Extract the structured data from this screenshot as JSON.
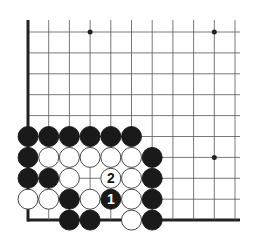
{
  "diagram": {
    "type": "go-board-corner",
    "grid": {
      "origin_x": 28,
      "origin_y": 32,
      "step_x": 20.7,
      "step_y": 20.9,
      "cols": 11,
      "rows": 10,
      "left_edge": true,
      "bottom_edge": true,
      "line_color": "#555555",
      "edge_color": "#222222"
    },
    "star_points": [
      [
        3,
        0
      ],
      [
        9,
        0
      ],
      [
        9,
        6
      ]
    ],
    "stones": [
      {
        "c": 0,
        "r": 5,
        "color": "black"
      },
      {
        "c": 1,
        "r": 5,
        "color": "black"
      },
      {
        "c": 2,
        "r": 5,
        "color": "black"
      },
      {
        "c": 3,
        "r": 5,
        "color": "black"
      },
      {
        "c": 4,
        "r": 5,
        "color": "black"
      },
      {
        "c": 5,
        "r": 5,
        "color": "black"
      },
      {
        "c": 0,
        "r": 6,
        "color": "black"
      },
      {
        "c": 1,
        "r": 6,
        "color": "white"
      },
      {
        "c": 2,
        "r": 6,
        "color": "white"
      },
      {
        "c": 3,
        "r": 6,
        "color": "white"
      },
      {
        "c": 4,
        "r": 6,
        "color": "white"
      },
      {
        "c": 5,
        "r": 6,
        "color": "white"
      },
      {
        "c": 6,
        "r": 6,
        "color": "black"
      },
      {
        "c": 0,
        "r": 7,
        "color": "black"
      },
      {
        "c": 1,
        "r": 7,
        "color": "black"
      },
      {
        "c": 2,
        "r": 7,
        "color": "white"
      },
      {
        "c": 4,
        "r": 7,
        "color": "white",
        "label": "2"
      },
      {
        "c": 5,
        "r": 7,
        "color": "white"
      },
      {
        "c": 6,
        "r": 7,
        "color": "black"
      },
      {
        "c": 0,
        "r": 8,
        "color": "white"
      },
      {
        "c": 1,
        "r": 8,
        "color": "white"
      },
      {
        "c": 2,
        "r": 8,
        "color": "black"
      },
      {
        "c": 3,
        "r": 8,
        "color": "white"
      },
      {
        "c": 4,
        "r": 8,
        "color": "black",
        "label": "1"
      },
      {
        "c": 5,
        "r": 8,
        "color": "white"
      },
      {
        "c": 6,
        "r": 8,
        "color": "black"
      },
      {
        "c": 2,
        "r": 9,
        "color": "black"
      },
      {
        "c": 3,
        "r": 9,
        "color": "black"
      },
      {
        "c": 5,
        "r": 9,
        "color": "white"
      },
      {
        "c": 6,
        "r": 9,
        "color": "black"
      }
    ],
    "move_labels": [
      "1",
      "2"
    ]
  }
}
